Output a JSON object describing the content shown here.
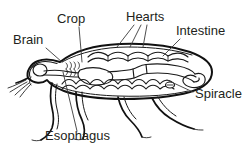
{
  "figure": {
    "kind": "anatomy-line-diagram",
    "background_color": "#ffffff",
    "line_color": "#111111",
    "label_color": "#231f20",
    "leader_color": "#3a3a3a",
    "width": 252,
    "height": 147
  },
  "labels": [
    {
      "id": "brain",
      "text": "Brain",
      "x": 13,
      "y": 44,
      "anchor": "start",
      "leader": "M46,48 L62,62"
    },
    {
      "id": "crop",
      "text": "Crop",
      "x": 57,
      "y": 23,
      "anchor": "start",
      "leader": "M79,27 L82,62"
    },
    {
      "id": "hearts",
      "text": "Hearts",
      "x": 126,
      "y": 21,
      "anchor": "start",
      "leader": "M134,25 L117,47 M141,25 L130,47 M147,25 L143,47"
    },
    {
      "id": "intestine",
      "text": "Intestine",
      "x": 176,
      "y": 35,
      "anchor": "start",
      "leader": "M180,39 L163,56"
    },
    {
      "id": "spiracle",
      "text": "Spiracle",
      "x": 195,
      "y": 98,
      "anchor": "start",
      "leader": "M193,92 L167,80"
    },
    {
      "id": "esophagus",
      "text": "Esophagus",
      "x": 45,
      "y": 140,
      "anchor": "start",
      "leader": "M77,131 L63,72"
    }
  ],
  "organs": [
    "brain-ganglion",
    "crop",
    "esophagus",
    "dorsal-vessel-hearts",
    "intestine",
    "gastric-caeca",
    "ventral-nerve-cord",
    "spiracle"
  ]
}
